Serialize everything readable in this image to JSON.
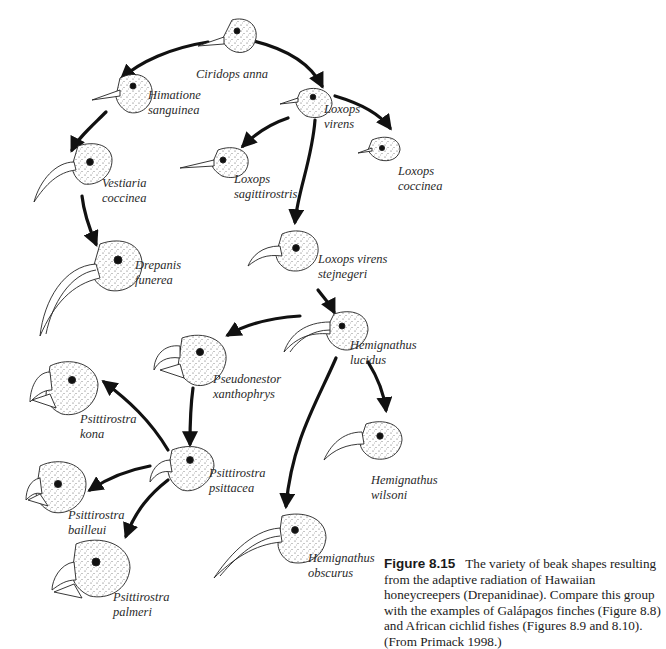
{
  "figure": {
    "number": "Figure 8.15",
    "caption": "The variety of beak shapes resulting from the adaptive radiation of Hawaiian honeycreepers (Drepanidinae). Compare this group with the examples of Galápagos finches (Figure 8.8) and African cichlid fishes (Figures 8.9 and 8.10). (From Primack 1998.)"
  },
  "species": [
    {
      "id": "ciridops-anna",
      "genus": "Ciridops anna",
      "epithet": ""
    },
    {
      "id": "himatione-sanguinea",
      "genus": "Himatione",
      "epithet": "sanguinea"
    },
    {
      "id": "loxops-virens",
      "genus": "Loxops",
      "epithet": "virens"
    },
    {
      "id": "loxops-coccinea",
      "genus": "Loxops",
      "epithet": "coccinea"
    },
    {
      "id": "loxops-sagittirostris",
      "genus": "Loxops",
      "epithet": "sagittirostris"
    },
    {
      "id": "vestiaria-coccinea",
      "genus": "Vestiaria",
      "epithet": "coccinea"
    },
    {
      "id": "drepanis-funerea",
      "genus": "Drepanis",
      "epithet": "funerea"
    },
    {
      "id": "loxops-virens-stejnegeri",
      "genus": "Loxops virens",
      "epithet": "stejnegeri"
    },
    {
      "id": "hemignathus-lucidus",
      "genus": "Hemignathus",
      "epithet": "lucidus"
    },
    {
      "id": "pseudonestor-xanthophrys",
      "genus": "Pseudonestor",
      "epithet": "xanthophrys"
    },
    {
      "id": "psittirostra-kona",
      "genus": "Psittirostra",
      "epithet": "kona"
    },
    {
      "id": "psittirostra-psittacea",
      "genus": "Psittirostra",
      "epithet": "psittacea"
    },
    {
      "id": "hemignathus-wilsoni",
      "genus": "Hemignathus",
      "epithet": "wilsoni"
    },
    {
      "id": "psittirostra-bailleui",
      "genus": "Psittirostra",
      "epithet": "bailleui"
    },
    {
      "id": "psittirostra-palmeri",
      "genus": "Psittirostra",
      "epithet": "palmeri"
    },
    {
      "id": "hemignathus-obscurus",
      "genus": "Hemignathus",
      "epithet": "obscurus"
    }
  ],
  "edges": [
    {
      "from": "ciridops-anna",
      "to": "himatione-sanguinea"
    },
    {
      "from": "ciridops-anna",
      "to": "loxops-virens"
    },
    {
      "from": "himatione-sanguinea",
      "to": "vestiaria-coccinea"
    },
    {
      "from": "vestiaria-coccinea",
      "to": "drepanis-funerea"
    },
    {
      "from": "loxops-virens",
      "to": "loxops-sagittirostris"
    },
    {
      "from": "loxops-virens",
      "to": "loxops-coccinea"
    },
    {
      "from": "loxops-virens",
      "to": "loxops-virens-stejnegeri"
    },
    {
      "from": "loxops-virens-stejnegeri",
      "to": "hemignathus-lucidus"
    },
    {
      "from": "hemignathus-lucidus",
      "to": "pseudonestor-xanthophrys"
    },
    {
      "from": "hemignathus-lucidus",
      "to": "hemignathus-wilsoni"
    },
    {
      "from": "hemignathus-lucidus",
      "to": "hemignathus-obscurus"
    },
    {
      "from": "pseudonestor-xanthophrys",
      "to": "psittirostra-psittacea"
    },
    {
      "from": "psittirostra-psittacea",
      "to": "psittirostra-kona"
    },
    {
      "from": "psittirostra-psittacea",
      "to": "psittirostra-bailleui"
    },
    {
      "from": "psittirostra-psittacea",
      "to": "psittirostra-palmeri"
    }
  ],
  "colors": {
    "ink": "#111111",
    "stipple": "#444444",
    "paper": "#ffffff"
  }
}
